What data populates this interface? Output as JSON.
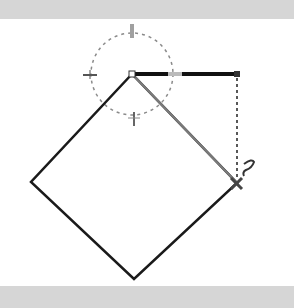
{
  "canvas": {
    "background": "#ffffff",
    "band_color": "#d6d6d6",
    "shape": {
      "type": "rotated-square",
      "points": [
        [
          132,
          74
        ],
        [
          237,
          183
        ],
        [
          134,
          279
        ],
        [
          31,
          182
        ]
      ],
      "stroke": "#1a1a1a"
    },
    "rotation_handle": {
      "center": [
        132,
        74
      ],
      "radius": 41,
      "stroke": "#888888"
    },
    "arm_bar": {
      "from": [
        132,
        74
      ],
      "to": [
        237,
        74
      ],
      "color": "#111111",
      "highlight": "#bbbbbb"
    },
    "dashed_guide": {
      "from": [
        237,
        74
      ],
      "to": [
        237,
        183
      ]
    },
    "diagonal_guide": {
      "from": [
        132,
        74
      ],
      "to": [
        237,
        183
      ],
      "color": "#777777"
    },
    "cursor": "rotate-cursor"
  }
}
